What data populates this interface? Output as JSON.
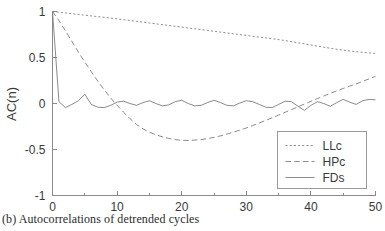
{
  "caption": "(b) Autocorrelations of detrended cycles",
  "chart_data": {
    "type": "line",
    "title": "",
    "xlabel": "",
    "ylabel": "AC(n)",
    "xlim": [
      0,
      50
    ],
    "ylim": [
      -1,
      1
    ],
    "grid": false,
    "legend_position": "bottom-right",
    "xticks": [
      0,
      10,
      20,
      30,
      40,
      50
    ],
    "xtick_labels": [
      "0",
      "10",
      "20",
      "30",
      "40",
      "50"
    ],
    "xminor_ticks": [
      5,
      15,
      25,
      35,
      45
    ],
    "yticks": [
      -1,
      -0.5,
      0,
      0.5,
      1
    ],
    "ytick_labels": [
      "-1",
      "-0.5",
      "0",
      "0.5",
      "1"
    ],
    "x": [
      0,
      1,
      2,
      3,
      4,
      5,
      6,
      7,
      8,
      9,
      10,
      11,
      12,
      13,
      14,
      15,
      16,
      17,
      18,
      19,
      20,
      21,
      22,
      23,
      24,
      25,
      26,
      27,
      28,
      29,
      30,
      31,
      32,
      33,
      34,
      35,
      36,
      37,
      38,
      39,
      40,
      41,
      42,
      43,
      44,
      45,
      46,
      47,
      48,
      49,
      50
    ],
    "series": [
      {
        "name": "LLc",
        "style": "dotted",
        "values": [
          1.0,
          0.992,
          0.984,
          0.976,
          0.968,
          0.96,
          0.952,
          0.944,
          0.936,
          0.928,
          0.92,
          0.911,
          0.902,
          0.893,
          0.884,
          0.875,
          0.866,
          0.857,
          0.848,
          0.839,
          0.83,
          0.821,
          0.812,
          0.803,
          0.794,
          0.785,
          0.776,
          0.767,
          0.758,
          0.749,
          0.74,
          0.731,
          0.722,
          0.713,
          0.704,
          0.695,
          0.684,
          0.672,
          0.66,
          0.648,
          0.636,
          0.624,
          0.612,
          0.6,
          0.59,
          0.58,
          0.571,
          0.563,
          0.556,
          0.55,
          0.545
        ]
      },
      {
        "name": "HPc",
        "style": "dashed",
        "values": [
          1.0,
          0.9,
          0.79,
          0.675,
          0.56,
          0.45,
          0.345,
          0.245,
          0.15,
          0.06,
          -0.02,
          -0.095,
          -0.165,
          -0.228,
          -0.275,
          -0.312,
          -0.34,
          -0.362,
          -0.38,
          -0.393,
          -0.4,
          -0.402,
          -0.398,
          -0.392,
          -0.382,
          -0.368,
          -0.352,
          -0.333,
          -0.312,
          -0.29,
          -0.266,
          -0.24,
          -0.212,
          -0.184,
          -0.156,
          -0.126,
          -0.096,
          -0.066,
          -0.036,
          -0.006,
          0.024,
          0.053,
          0.082,
          0.11,
          0.137,
          0.163,
          0.188,
          0.212,
          0.24,
          0.268,
          0.295
        ]
      },
      {
        "name": "FDs",
        "style": "solid",
        "values": [
          1.0,
          0.02,
          -0.045,
          -0.01,
          0.03,
          0.1,
          -0.01,
          -0.04,
          -0.045,
          -0.02,
          0.015,
          0.025,
          0.0,
          -0.02,
          0.01,
          0.03,
          0.0,
          -0.025,
          -0.015,
          0.02,
          0.035,
          0.0,
          -0.025,
          -0.02,
          0.01,
          0.035,
          0.01,
          -0.02,
          -0.025,
          0.005,
          0.03,
          0.02,
          -0.01,
          -0.04,
          -0.045,
          -0.01,
          0.025,
          0.02,
          -0.03,
          -0.075,
          -0.02,
          0.02,
          0.0,
          -0.03,
          0.01,
          0.045,
          0.015,
          -0.01,
          0.03,
          0.045,
          0.04
        ]
      }
    ],
    "legend_entries": [
      {
        "label": "LLc",
        "style": "dotted"
      },
      {
        "label": "HPc",
        "style": "dashed"
      },
      {
        "label": "FDs",
        "style": "solid"
      }
    ]
  }
}
